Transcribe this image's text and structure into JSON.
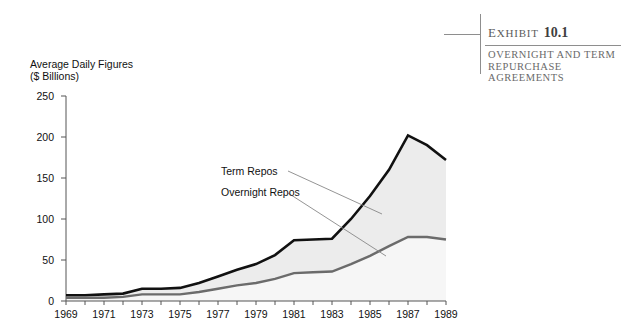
{
  "exhibit": {
    "label_prefix": "E",
    "label_rest": "XHIBIT",
    "number": "10.1",
    "subtitle": "OVERNIGHT AND TERM REPURCHASE AGREEMENTS"
  },
  "axis_caption": "Average Daily Figures\n($ Billions)",
  "annotations": {
    "term": "Term Repos",
    "overnight": "Overnight Repos"
  },
  "colors": {
    "term_line": "#111111",
    "overnight_line": "#6b6b6b",
    "area_fill": "#ececec",
    "axis": "#555555",
    "leader": "#888888",
    "rule": "#8e8e8e"
  },
  "chart_data": {
    "type": "area",
    "title": "Overnight and Term Repurchase Agreements",
    "xlabel": "",
    "ylabel": "Average Daily Figures ($ Billions)",
    "xlim": [
      1969,
      1989
    ],
    "ylim": [
      0,
      250
    ],
    "yticks": [
      0,
      50,
      100,
      150,
      200,
      250
    ],
    "xticks": [
      1969,
      1971,
      1973,
      1975,
      1977,
      1979,
      1981,
      1983,
      1985,
      1987,
      1989
    ],
    "xtick_minor_every": 1,
    "grid": false,
    "legend": "inline annotations",
    "x": [
      1969,
      1970,
      1971,
      1972,
      1973,
      1974,
      1975,
      1976,
      1977,
      1978,
      1979,
      1980,
      1981,
      1982,
      1983,
      1984,
      1985,
      1986,
      1987,
      1988,
      1989
    ],
    "series": [
      {
        "name": "Term Repos",
        "note": "upper boundary: total of overnight plus term repos",
        "values": [
          7,
          7,
          8,
          9,
          15,
          15,
          16,
          22,
          30,
          38,
          45,
          56,
          74,
          75,
          76,
          100,
          128,
          160,
          202,
          190,
          172
        ]
      },
      {
        "name": "Overnight Repos",
        "note": "lower boundary line",
        "values": [
          4,
          4,
          4,
          5,
          8,
          8,
          8,
          11,
          15,
          19,
          22,
          27,
          34,
          35,
          36,
          45,
          55,
          67,
          78,
          78,
          75
        ]
      }
    ]
  }
}
